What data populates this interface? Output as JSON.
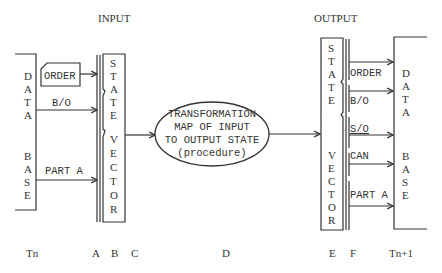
{
  "diagram": {
    "headers": {
      "input": "INPUT",
      "output": "OUTPUT"
    },
    "input_database": {
      "word1": [
        "D",
        "A",
        "T",
        "A"
      ],
      "word2": [
        "B",
        "A",
        "S",
        "E"
      ]
    },
    "input_records": [
      {
        "label": "ORDER",
        "shape": "card"
      },
      {
        "label": "B/O",
        "shape": "arrow"
      },
      {
        "label": "PART A",
        "shape": "arrow"
      }
    ],
    "input_state_vector": {
      "word1": [
        "S",
        "T",
        "A",
        "T",
        "E"
      ],
      "word2": [
        "V",
        "E",
        "C",
        "T",
        "O",
        "R"
      ]
    },
    "transformation": {
      "lines": [
        "TRANSFORMATION",
        "MAP OF INPUT",
        "TO OUTPUT STATE",
        "(procedure)"
      ]
    },
    "output_state_vector": {
      "word1": [
        "S",
        "T",
        "A",
        "T",
        "E"
      ],
      "word2": [
        "V",
        "E",
        "C",
        "T",
        "O",
        "R"
      ]
    },
    "output_records": [
      {
        "label": "ORDER"
      },
      {
        "label": "B/O"
      },
      {
        "label": "S/O"
      },
      {
        "label": "CAN"
      },
      {
        "label": "PART A"
      }
    ],
    "output_database": {
      "word1": [
        "D",
        "A",
        "T",
        "A"
      ],
      "word2": [
        "B",
        "A",
        "S",
        "E"
      ]
    },
    "axis_labels": {
      "tn": "Tn",
      "a": "A",
      "b": "B",
      "c": "C",
      "d": "D",
      "e": "E",
      "f": "F",
      "tn1": "Tn+1"
    },
    "colors": {
      "ink": "#333333",
      "background": "#ffffff"
    }
  }
}
